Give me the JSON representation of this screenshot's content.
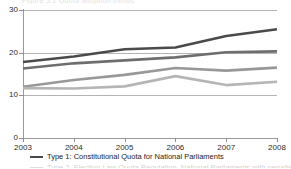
{
  "header_ghost": "Figure 3.1  Quota adoption trends",
  "chart_data": {
    "type": "line",
    "title": "",
    "subtitle": "",
    "xlabel": "",
    "ylabel": "",
    "x": [
      2003,
      2004,
      2005,
      2006,
      2007,
      2008
    ],
    "categories": [
      "2003",
      "2004",
      "2005",
      "2006",
      "2007",
      "2008"
    ],
    "xlim": [
      2003,
      2008
    ],
    "ylim": [
      0,
      30
    ],
    "yticks": [
      0,
      10,
      20,
      30
    ],
    "ytick_labels": [
      "0",
      "10",
      "20",
      "30"
    ],
    "xtick_labels": [
      "2003",
      "2004",
      "2005",
      "2006",
      "2007",
      "2008"
    ],
    "grid": "horizontal",
    "legend_position": "bottom-left",
    "series": [
      {
        "name": "Type 1: Constitutional Quota for National Parliaments",
        "color": "#4a4a4a",
        "values": [
          17.8,
          19.1,
          20.8,
          21.2,
          23.9,
          25.5
        ]
      },
      {
        "name": "Type 2: Election Law Quota Regulation, National Parliaments",
        "color": "#6e6e6e",
        "values": [
          16.3,
          17.5,
          18.2,
          18.9,
          20.1,
          20.3
        ]
      },
      {
        "name": "Type 3: Political Party Quota for Electoral Candidates",
        "color": "#989898",
        "values": [
          12.0,
          13.6,
          14.8,
          16.4,
          15.8,
          16.5
        ]
      },
      {
        "name": "Type 4: Sub-National Government Quota",
        "color": "#b5b5b5",
        "values": [
          11.7,
          11.6,
          12.1,
          14.5,
          12.4,
          13.2
        ]
      }
    ]
  },
  "legend": {
    "items": [
      {
        "label": "Type 1: Constitutional Quota for National Parliaments",
        "color": "#4a4a4a",
        "clipped": false
      },
      {
        "label": "Type 2: Election Law Quota Regulation, National Parliaments with penalties",
        "color": "#6e6e6e",
        "clipped": true
      }
    ]
  }
}
